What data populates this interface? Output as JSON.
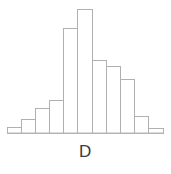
{
  "figure": {
    "label": "D",
    "background_color": "#ffffff",
    "line_color": "#b0b0b0",
    "baseline_color": "#b8b8b8",
    "label_color": "#3b3b3b"
  },
  "chart_data": {
    "type": "bar",
    "title": "D",
    "subtitle": "",
    "xlabel": "",
    "ylabel": "",
    "grid": false,
    "legend": null,
    "axis": {
      "x_visible": true,
      "y_visible": false,
      "baseline_y_px": 133,
      "left_px": 7,
      "right_px": 163
    },
    "categories": [
      "1",
      "2",
      "3",
      "4",
      "5",
      "6",
      "7",
      "8",
      "9",
      "10",
      "11"
    ],
    "tick_labels": [],
    "values": [
      6,
      14,
      25,
      33,
      105,
      124,
      73,
      67,
      54,
      17,
      5
    ],
    "ylim": [
      0,
      130
    ],
    "bar_tops_px": [
      127,
      119,
      108,
      100,
      28,
      9,
      60,
      66,
      79,
      116,
      128
    ],
    "bar_width_px": 14.2
  }
}
